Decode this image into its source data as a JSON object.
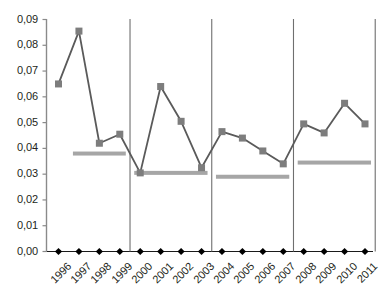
{
  "chart_data": {
    "type": "line",
    "title": "",
    "subtitle": "",
    "xlabel": "",
    "ylabel": "",
    "ylim": [
      0.0,
      0.09
    ],
    "grid": false,
    "legend": "none",
    "decimal_separator": ",",
    "categories": [
      "1996",
      "1997",
      "1998",
      "1999",
      "2000",
      "2001",
      "2002",
      "2003",
      "2004",
      "2005",
      "2006",
      "2007",
      "2008",
      "2009",
      "2010",
      "2011"
    ],
    "ytick_labels": [
      "0,09",
      "0,08",
      "0,07",
      "0,06",
      "0,05",
      "0,04",
      "0,03",
      "0,02",
      "0,01",
      "0,00"
    ],
    "ytick_values": [
      0.09,
      0.08,
      0.07,
      0.06,
      0.05,
      0.04,
      0.03,
      0.02,
      0.01,
      0.0
    ],
    "series": [
      {
        "name": "value",
        "marker": "square",
        "marker_color": "#7d7d7d",
        "line_color": "#5a5a5a",
        "values": [
          0.065,
          0.0855,
          0.042,
          0.0455,
          0.0305,
          0.064,
          0.0505,
          0.0325,
          0.0465,
          0.044,
          0.039,
          0.034,
          0.0495,
          0.046,
          0.0575,
          0.0495
        ]
      },
      {
        "name": "baseline-markers",
        "marker": "diamond",
        "marker_color": "#000000",
        "line_color": "#000000",
        "values": [
          0.0,
          0.0,
          0.0,
          0.0,
          0.0,
          0.0,
          0.0,
          0.0,
          0.0,
          0.0,
          0.0,
          0.0,
          0.0,
          0.0,
          0.0,
          0.0
        ]
      }
    ],
    "period_averages": [
      {
        "label": "1997-1999",
        "value": 0.038,
        "start_year": "1997",
        "end_year": "1999",
        "color": "#a6a6a6"
      },
      {
        "label": "2000-2003",
        "value": 0.0305,
        "start_year": "2000",
        "end_year": "2003",
        "color": "#a6a6a6"
      },
      {
        "label": "2004-2007",
        "value": 0.029,
        "start_year": "2004",
        "end_year": "2007",
        "color": "#a6a6a6"
      },
      {
        "label": "2008-2011",
        "value": 0.0345,
        "start_year": "2008",
        "end_year": "2011",
        "color": "#a6a6a6"
      }
    ],
    "period_separators": [
      {
        "after_year": "1999",
        "x_year_index": 3.5
      },
      {
        "after_year": "2003",
        "x_year_index": 7.5
      },
      {
        "after_year": "2007",
        "x_year_index": 11.5
      },
      {
        "after_year": "2011",
        "x_year_index": 15.5
      }
    ],
    "colors": {
      "axis": "#8a8a8a",
      "separator": "#6f6f6f",
      "line": "#5a5a5a",
      "marker": "#7d7d7d",
      "average_bar": "#a6a6a6",
      "baseline_marker": "#000000",
      "text": "#231f20",
      "background": "#ffffff"
    }
  }
}
